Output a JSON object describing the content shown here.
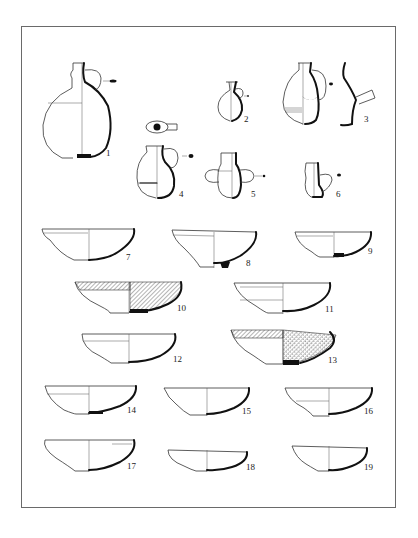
{
  "plate": {
    "frame": {
      "x": 21,
      "y": 26,
      "width": 375,
      "height": 482,
      "border_color": "#6a6a6a"
    },
    "ink_color": "#111111",
    "background": "#ffffff"
  },
  "figures": [
    {
      "id": 1,
      "label": "1",
      "type": "flask-jug",
      "label_pos": [
        106,
        153
      ]
    },
    {
      "id": 2,
      "label": "2",
      "type": "juglet",
      "label_pos": [
        244,
        119
      ]
    },
    {
      "id": 3,
      "label": "3",
      "type": "decorated-jug-with-spout-section",
      "label_pos": [
        364,
        119
      ]
    },
    {
      "id": 4,
      "label": "4",
      "type": "jug",
      "label_pos": [
        179,
        194
      ]
    },
    {
      "id": 5,
      "label": "5",
      "type": "two-handled-jar",
      "label_pos": [
        251,
        194
      ]
    },
    {
      "id": 6,
      "label": "6",
      "type": "small-jug",
      "label_pos": [
        336,
        194
      ]
    },
    {
      "id": 7,
      "label": "7",
      "type": "bowl",
      "label_pos": [
        126,
        256
      ]
    },
    {
      "id": 8,
      "label": "8",
      "type": "bowl",
      "label_pos": [
        246,
        262
      ]
    },
    {
      "id": 9,
      "label": "9",
      "type": "bowl",
      "label_pos": [
        368,
        250
      ]
    },
    {
      "id": 10,
      "label": "10",
      "type": "bowl-hatched",
      "label_pos": [
        177,
        307
      ]
    },
    {
      "id": 11,
      "label": "11",
      "type": "bowl",
      "label_pos": [
        325,
        308
      ]
    },
    {
      "id": 12,
      "label": "12",
      "type": "bowl",
      "label_pos": [
        173,
        358
      ]
    },
    {
      "id": 13,
      "label": "13",
      "type": "bowl-dotted",
      "label_pos": [
        328,
        359
      ]
    },
    {
      "id": 14,
      "label": "14",
      "type": "bowl",
      "label_pos": [
        127,
        409
      ]
    },
    {
      "id": 15,
      "label": "15",
      "type": "bowl",
      "label_pos": [
        242,
        410
      ]
    },
    {
      "id": 16,
      "label": "16",
      "type": "bowl",
      "label_pos": [
        364,
        410
      ]
    },
    {
      "id": 17,
      "label": "17",
      "type": "bowl",
      "label_pos": [
        127,
        465
      ]
    },
    {
      "id": 18,
      "label": "18",
      "type": "bowl",
      "label_pos": [
        246,
        466
      ]
    },
    {
      "id": 19,
      "label": "19",
      "type": "bowl",
      "label_pos": [
        364,
        466
      ]
    }
  ]
}
